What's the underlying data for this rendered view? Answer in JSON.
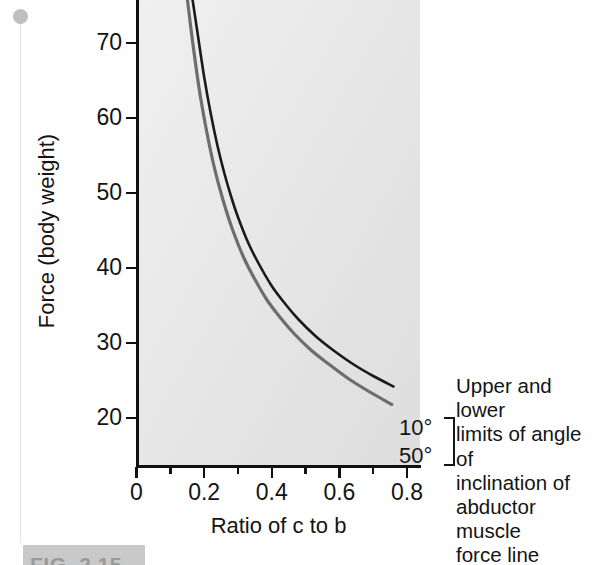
{
  "figure": {
    "caption": "FIG. 2.15"
  },
  "chart_data": {
    "type": "line",
    "title": "",
    "xlabel": "Ratio of c to b",
    "ylabel": "Force (body weight)",
    "xlim": [
      0,
      0.84
    ],
    "ylim": [
      18.0,
      76.0
    ],
    "grid": false,
    "legend_position": "right-inline",
    "x_ticks": [
      "0",
      "",
      "0.2",
      "",
      "0.4",
      "",
      "0.6",
      "",
      "0.8"
    ],
    "x_tick_values": [
      0,
      0.1,
      0.2,
      0.3,
      0.4,
      0.5,
      0.6,
      0.7,
      0.8
    ],
    "x_tick_labels": [
      "0",
      "0.2",
      "0.4",
      "0.6",
      "0.8"
    ],
    "y_tick_values": [
      20,
      30,
      40,
      50,
      60,
      70
    ],
    "y_tick_labels": [
      "20",
      "30",
      "40",
      "50",
      "60",
      "70"
    ],
    "series": [
      {
        "name": "10°",
        "label": "10°",
        "color": "#1a1a1a",
        "width": 2.6,
        "description": "upper limit of angle of inclination",
        "x": [
          0.165,
          0.18,
          0.2,
          0.22,
          0.24,
          0.26,
          0.28,
          0.3,
          0.33,
          0.36,
          0.4,
          0.44,
          0.48,
          0.53,
          0.58,
          0.64,
          0.7,
          0.76
        ],
        "y": [
          76.0,
          71.5,
          65.5,
          60.5,
          56.2,
          52.6,
          49.5,
          46.8,
          43.4,
          40.7,
          37.6,
          35.2,
          33.1,
          30.9,
          29.1,
          27.2,
          25.6,
          24.2
        ]
      },
      {
        "name": "50°",
        "label": "50°",
        "color": "#6d6d6d",
        "width": 3.2,
        "description": "lower limit of angle of inclination",
        "x": [
          0.15,
          0.165,
          0.185,
          0.205,
          0.225,
          0.245,
          0.265,
          0.285,
          0.315,
          0.345,
          0.385,
          0.425,
          0.465,
          0.515,
          0.565,
          0.625,
          0.685,
          0.755
        ],
        "y": [
          76.0,
          70.5,
          64.0,
          58.8,
          54.4,
          50.8,
          47.7,
          45.0,
          41.6,
          38.9,
          35.8,
          33.4,
          31.3,
          29.1,
          27.3,
          25.3,
          23.6,
          21.8
        ]
      }
    ],
    "annotations": [
      {
        "name": "limits-note",
        "text": "Upper and lower limits of angle of inclination of abductor muscle force line",
        "lines": [
          "Upper and lower",
          "limits of angle of",
          "inclination of",
          "abductor muscle",
          "force line"
        ]
      }
    ]
  },
  "colors": {
    "upper_curve": "#1a1a1a",
    "lower_curve": "#6d6d6d",
    "axis": "#111111",
    "plot_background": "#e9e9e9",
    "text": "#141414"
  }
}
